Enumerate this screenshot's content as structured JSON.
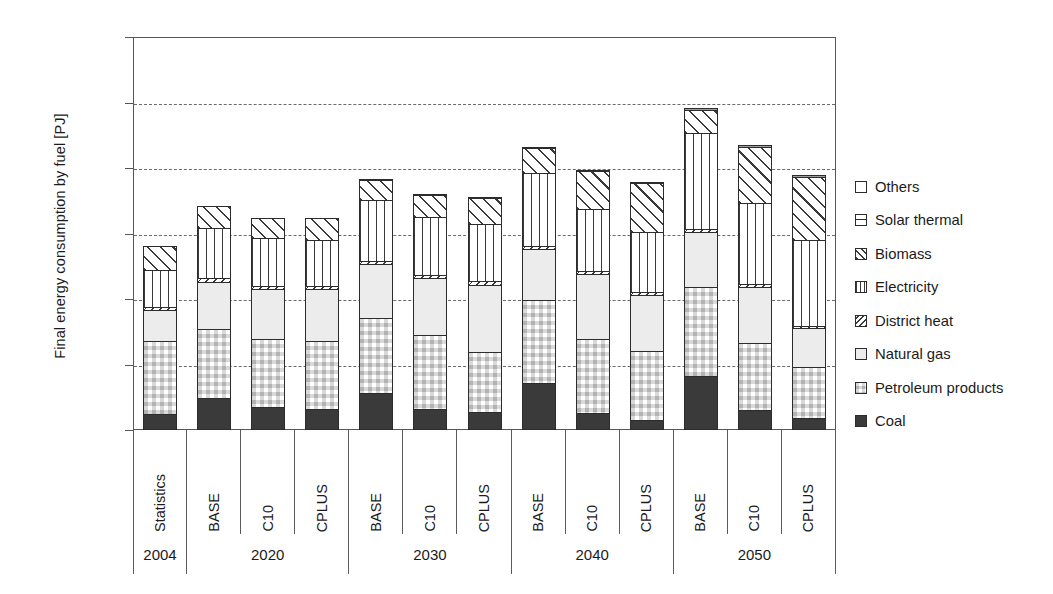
{
  "chart_data": {
    "type": "bar",
    "subtype": "stacked-bar",
    "title": "",
    "xlabel": "",
    "ylabel": "Final energy consumption by fuel [PJ]",
    "ylim": [
      0,
      600000
    ],
    "yticks": [
      0,
      100000,
      200000,
      300000,
      400000,
      500000,
      600000
    ],
    "ytick_labels": [
      "0",
      "100,000",
      "200,000",
      "300,000",
      "400,000",
      "500,000",
      "600,000"
    ],
    "grid": true,
    "grid_style": "dashed horizontal",
    "legend_position": "right",
    "group_labels": [
      "2004",
      "2020",
      "2030",
      "2040",
      "2050"
    ],
    "group_sizes": [
      1,
      3,
      3,
      3,
      3
    ],
    "categories": [
      "Statistics",
      "BASE",
      "C10",
      "CPLUS",
      "BASE",
      "C10",
      "CPLUS",
      "BASE",
      "C10",
      "CPLUS",
      "BASE",
      "C10",
      "CPLUS"
    ],
    "stack_order_bottom_to_top": [
      "Coal",
      "Petroleum products",
      "Natural gas",
      "District heat",
      "Electricity",
      "Biomass",
      "Solar thermal",
      "Others"
    ],
    "series": [
      {
        "name": "Coal",
        "key": "coal",
        "pattern": "solid-dark",
        "values": [
          25000,
          49000,
          35000,
          32000,
          57000,
          32000,
          28000,
          72000,
          26000,
          15000,
          83000,
          30000,
          19000
        ]
      },
      {
        "name": "Petroleum products",
        "key": "petroleum",
        "pattern": "checkerboard",
        "values": [
          113000,
          107000,
          105000,
          106000,
          116000,
          114000,
          93000,
          128000,
          115000,
          107000,
          137000,
          104000,
          78000
        ]
      },
      {
        "name": "Natural gas",
        "key": "natural_gas",
        "pattern": "light-solid",
        "values": [
          49000,
          73000,
          78000,
          80000,
          83000,
          89000,
          104000,
          80000,
          101000,
          87000,
          86000,
          88000,
          62000
        ]
      },
      {
        "name": "District heat",
        "key": "district_heat",
        "pattern": "back-hatch",
        "values": [
          6000,
          7000,
          7000,
          7000,
          7000,
          7000,
          7000,
          6000,
          6000,
          6000,
          5000,
          5000,
          5000
        ]
      },
      {
        "name": "Electricity",
        "key": "electricity",
        "pattern": "vertical-lines",
        "values": [
          58000,
          78000,
          74000,
          72000,
          95000,
          89000,
          88000,
          112000,
          96000,
          93000,
          148000,
          126000,
          132000
        ]
      },
      {
        "name": "Biomass",
        "key": "biomass",
        "pattern": "forward-hatch",
        "values": [
          38000,
          35000,
          33000,
          35000,
          31000,
          36000,
          42000,
          40000,
          59000,
          77000,
          38000,
          87000,
          98000
        ]
      },
      {
        "name": "Solar thermal",
        "key": "solar_thermal",
        "pattern": "grey-solid",
        "values": [
          0,
          0,
          0,
          0,
          1000,
          1000,
          1000,
          2000,
          3000,
          3000,
          4000,
          5000,
          5000
        ]
      },
      {
        "name": "Others",
        "key": "others",
        "pattern": "white",
        "values": [
          0,
          0,
          0,
          0,
          0,
          0,
          0,
          0,
          0,
          0,
          0,
          0,
          0
        ]
      }
    ],
    "totals": [
      289000,
      349000,
      332000,
      332000,
      390000,
      368000,
      363000,
      440000,
      406000,
      388000,
      501000,
      445000,
      399000
    ]
  },
  "legend": {
    "items": [
      {
        "label": "Others",
        "key": "others",
        "css": "f-others"
      },
      {
        "label": "Solar thermal",
        "key": "solar_thermal",
        "css": "f-solar"
      },
      {
        "label": "Biomass",
        "key": "biomass",
        "css": "f-biomass"
      },
      {
        "label": "Electricity",
        "key": "electricity",
        "css": "f-elec"
      },
      {
        "label": "District heat",
        "key": "district_heat",
        "css": "f-district"
      },
      {
        "label": "Natural gas",
        "key": "natural_gas",
        "css": "f-natgas"
      },
      {
        "label": "Petroleum products",
        "key": "petroleum",
        "css": "f-petroleum"
      },
      {
        "label": "Coal",
        "key": "coal",
        "css": "f-coal"
      }
    ]
  },
  "colors": {
    "axis": "#55565a",
    "grid": "#6a6b6f",
    "coal": "#3a3a3a",
    "natural_gas": "#ececec",
    "solar_thermal": "#9d9d9d",
    "background": "#ffffff",
    "text": "#1b1b1b"
  }
}
